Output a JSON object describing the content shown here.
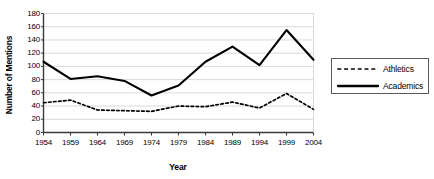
{
  "chart_data": {
    "type": "line",
    "title": "",
    "xlabel": "Year",
    "ylabel": "Number of Mentions",
    "x": [
      1954,
      1959,
      1964,
      1969,
      1974,
      1979,
      1984,
      1989,
      1994,
      1999,
      2004
    ],
    "categories": [
      "1954",
      "1959",
      "1964",
      "1969",
      "1974",
      "1979",
      "1984",
      "1989",
      "1994",
      "1999",
      "2004"
    ],
    "xlim": [
      1952,
      2006
    ],
    "ylim": [
      0,
      180
    ],
    "ytick_values": [
      0,
      20,
      40,
      60,
      80,
      100,
      120,
      140,
      160,
      180
    ],
    "ytick_labels": [
      "0",
      "20",
      "40",
      "60",
      "80",
      "100",
      "120",
      "140",
      "160",
      "180"
    ],
    "xtick_labels": [
      "1954",
      "1959",
      "1964",
      "1969",
      "1974",
      "1979",
      "1984",
      "1989",
      "1994",
      "1999",
      "2004"
    ],
    "grid": "horizontal",
    "legend_position": "right",
    "series": [
      {
        "name": "Athletics",
        "style": "dashed",
        "color": "#000000",
        "values": [
          45,
          49,
          34,
          33,
          32,
          40,
          39,
          46,
          37,
          59,
          35
        ]
      },
      {
        "name": "Academics",
        "style": "solid",
        "color": "#000000",
        "values": [
          107,
          81,
          85,
          78,
          56,
          71,
          107,
          130,
          102,
          155,
          110
        ]
      }
    ],
    "legend": [
      {
        "label": "Athletics",
        "style": "dashed"
      },
      {
        "label": "Academics",
        "style": "solid"
      }
    ]
  },
  "colors": {
    "axis": "#3a3a3a",
    "grid": "#d9d9d9",
    "series": "#000000",
    "legend_border": "#5a5a5a",
    "background": "#ffffff"
  }
}
